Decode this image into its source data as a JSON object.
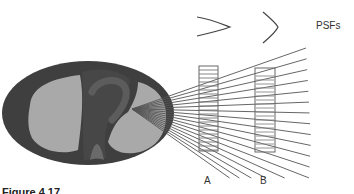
{
  "figure": {
    "labels": {
      "psfs": "PSFs",
      "detector_a": "A",
      "detector_b": "B"
    },
    "caption": "Figure 4.17",
    "colors": {
      "body_outer": "#3f3f3f",
      "lung": "#a9a9a9",
      "mediastinum": "#4a4a4a",
      "heart_tube": "#5c5c5c",
      "spine": "#6a6a6a",
      "rays": "#555555",
      "detector": "#666666",
      "psf_curve": "#444444",
      "text": "#333333"
    },
    "source_point": {
      "x": 132,
      "y": 109
    },
    "detectors": [
      {
        "name": "A",
        "x": 199,
        "y_top": 66,
        "y_bottom": 151,
        "width": 19
      },
      {
        "name": "B",
        "x": 255,
        "y_top": 68,
        "y_bottom": 152,
        "width": 20
      }
    ]
  }
}
